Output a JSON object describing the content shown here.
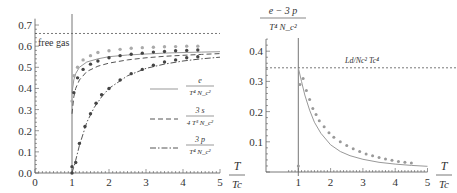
{
  "chart_data": [
    {
      "type": "line",
      "title": "",
      "xlabel_num": "T",
      "xlabel_den": "T_c",
      "ylabel": "",
      "xlim": [
        0,
        5
      ],
      "ylim": [
        0,
        0.7
      ],
      "xticks": [
        "0",
        "1",
        "2",
        "3",
        "4",
        "5"
      ],
      "yticks": [
        "0.0",
        "0.1",
        "0.2",
        "0.3",
        "0.4",
        "0.5",
        "0.6",
        "0.7"
      ],
      "grid": false,
      "annotations": [
        {
          "text": "free gas",
          "y": 0.66,
          "style": "dotted-horizontal"
        },
        {
          "text": "",
          "x": 1.0,
          "style": "vertical-line"
        }
      ],
      "legend_position": "bottom-right",
      "series": [
        {
          "name": "e / (T^4 N_c^2)",
          "legend_num": "e",
          "legend_den": "T⁴ N_c²",
          "style": "solid",
          "curve": {
            "x": [
              1.0,
              1.05,
              1.1,
              1.2,
              1.4,
              1.7,
              2.0,
              2.5,
              3.0,
              3.5,
              4.0,
              4.5,
              5.0
            ],
            "y": [
              0.38,
              0.44,
              0.47,
              0.5,
              0.525,
              0.54,
              0.55,
              0.558,
              0.563,
              0.567,
              0.57,
              0.572,
              0.574
            ]
          },
          "points": {
            "x": [
              1.0,
              1.05,
              1.15,
              1.3,
              1.5,
              1.7,
              2.0,
              2.3,
              2.6,
              2.9,
              3.2,
              3.5,
              3.8,
              4.1,
              4.4
            ],
            "y": [
              0.34,
              0.46,
              0.5,
              0.535,
              0.555,
              0.57,
              0.578,
              0.585,
              0.59,
              0.593,
              0.595,
              0.597,
              0.598,
              0.6,
              0.6
            ]
          }
        },
        {
          "name": "3s / (4 T^3 N_c^2)",
          "legend_num": "3 s",
          "legend_den": "4 T³ N_c²",
          "style": "dashed",
          "curve": {
            "x": [
              1.0,
              1.05,
              1.1,
              1.2,
              1.4,
              1.7,
              2.0,
              2.5,
              3.0,
              3.5,
              4.0,
              4.5,
              5.0
            ],
            "y": [
              0.28,
              0.36,
              0.4,
              0.44,
              0.48,
              0.505,
              0.52,
              0.535,
              0.545,
              0.552,
              0.557,
              0.561,
              0.565
            ]
          },
          "points": {
            "x": [
              1.0,
              1.05,
              1.15,
              1.3,
              1.5,
              1.7,
              2.0,
              2.3,
              2.6,
              2.9,
              3.2,
              3.5,
              3.8,
              4.1,
              4.4
            ],
            "y": [
              0.03,
              0.38,
              0.45,
              0.49,
              0.515,
              0.53,
              0.545,
              0.555,
              0.562,
              0.567,
              0.572,
              0.575,
              0.578,
              0.58,
              0.582
            ]
          }
        },
        {
          "name": "3p / (T^4 N_c^2)",
          "legend_num": "3 p",
          "legend_den": "T⁴ N_c²",
          "style": "dash-dot",
          "curve": {
            "x": [
              1.0,
              1.1,
              1.2,
              1.4,
              1.6,
              1.8,
              2.0,
              2.5,
              3.0,
              3.5,
              4.0,
              4.5,
              5.0
            ],
            "y": [
              0.0,
              0.06,
              0.13,
              0.24,
              0.31,
              0.36,
              0.4,
              0.46,
              0.495,
              0.515,
              0.53,
              0.54,
              0.548
            ]
          },
          "points": {
            "x": [
              1.0,
              1.1,
              1.2,
              1.35,
              1.5,
              1.65,
              1.8,
              2.0,
              2.3,
              2.6,
              2.9,
              3.2,
              3.5,
              3.8,
              4.1,
              4.4
            ],
            "y": [
              0.0,
              0.05,
              0.14,
              0.22,
              0.28,
              0.33,
              0.37,
              0.4,
              0.44,
              0.47,
              0.49,
              0.51,
              0.525,
              0.535,
              0.545,
              0.55
            ]
          }
        }
      ]
    },
    {
      "type": "line",
      "title": "",
      "ylabel_num": "e − 3 p",
      "ylabel_den": "T⁴ N_c²",
      "xlabel_num": "T",
      "xlabel_den": "T_c",
      "xlim": [
        0.65,
        5
      ],
      "ylim": [
        0,
        0.45
      ],
      "xticks": [
        "1",
        "2",
        "3",
        "4",
        "5"
      ],
      "yticks": [
        "0.1",
        "0.2",
        "0.3",
        "0.4"
      ],
      "grid": false,
      "annotations": [
        {
          "text": "L_d/N_c² T_c⁴",
          "y": 0.345,
          "style": "dotted-horizontal"
        },
        {
          "text": "",
          "x": 1.0,
          "style": "vertical-line"
        }
      ],
      "series": [
        {
          "name": "(e - 3p) / (T^4 N_c^2)",
          "style": "solid",
          "curve": {
            "x": [
              1.0,
              1.1,
              1.2,
              1.35,
              1.5,
              1.7,
              2.0,
              2.3,
              2.6,
              3.0,
              3.5,
              4.0,
              4.5,
              5.0
            ],
            "y": [
              0.345,
              0.3,
              0.255,
              0.205,
              0.165,
              0.128,
              0.09,
              0.068,
              0.054,
              0.042,
              0.032,
              0.026,
              0.022,
              0.019
            ]
          },
          "points": {
            "x": [
              1.0,
              1.05,
              1.15,
              1.25,
              1.35,
              1.45,
              1.55,
              1.65,
              1.8,
              1.95,
              2.1,
              2.3,
              2.5,
              2.7,
              2.9,
              3.1,
              3.3,
              3.5,
              3.7,
              3.9,
              4.1,
              4.3,
              4.5
            ],
            "y": [
              0.02,
              0.29,
              0.31,
              0.27,
              0.24,
              0.21,
              0.19,
              0.17,
              0.15,
              0.13,
              0.115,
              0.1,
              0.088,
              0.077,
              0.068,
              0.06,
              0.054,
              0.048,
              0.043,
              0.039,
              0.035,
              0.032,
              0.03
            ]
          }
        }
      ]
    }
  ]
}
